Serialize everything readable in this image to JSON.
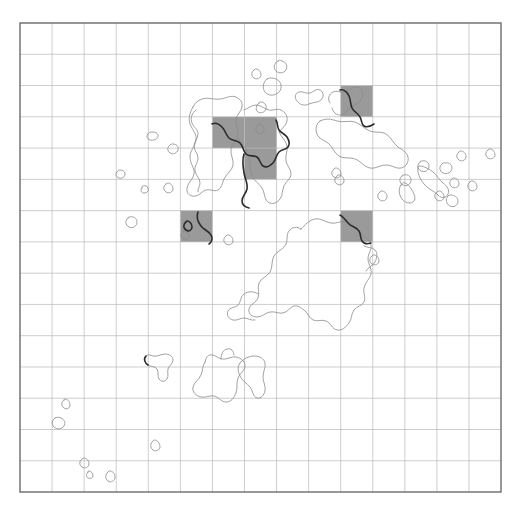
{
  "figure": {
    "kind": "map-grid-overlay",
    "background_color": "#ffffff",
    "width": 517,
    "height": 508
  },
  "plot_frame": {
    "name": "plot-frame",
    "x": 20,
    "y": 23,
    "width": 481,
    "height": 469,
    "border_color": "#6b6b6b",
    "border_width": 1.4,
    "fill": "#ffffff"
  },
  "grid": {
    "name": "grid",
    "columns": 15,
    "rows": 15,
    "cell_width": 32.07,
    "cell_height": 31.27,
    "line_color": "#b8b8b8",
    "line_width": 0.7,
    "visible": true
  },
  "highlighted_cells": {
    "fill_color": "#9a9a9a",
    "label": "selected grid cells",
    "count": 5,
    "cells": [
      {
        "id": "cell-c10-r2",
        "col": 10,
        "row": 2
      },
      {
        "id": "cell-c6-r3",
        "col": 6,
        "row": 3
      },
      {
        "id": "cell-c7-r3",
        "col": 7,
        "row": 3
      },
      {
        "id": "cell-c7-r4",
        "col": 7,
        "row": 4
      },
      {
        "id": "cell-c5-r6",
        "col": 5,
        "row": 6
      },
      {
        "id": "cell-c10-r6",
        "col": 10,
        "row": 6
      }
    ]
  },
  "coastlines": {
    "name": "coastline-contours",
    "thin_color": "#8a8a8a",
    "thin_width": 0.8,
    "bold_color": "#2b2b2b",
    "bold_width": 1.6,
    "description": "island and landmass outlines drawn over the grid"
  },
  "legend": {
    "visible": false
  }
}
